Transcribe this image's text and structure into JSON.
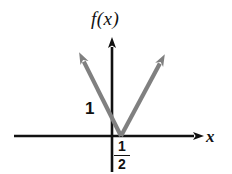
{
  "figure": {
    "width": 232,
    "height": 174,
    "background_color": "#ffffff"
  },
  "labels": {
    "function_label": "f(x)",
    "x_axis_label": "x",
    "y_intercept_label": "1",
    "vertex_fraction_numerator": "1",
    "vertex_fraction_denominator": "2"
  },
  "colors": {
    "axis_color": "#111111",
    "curve_color": "#808080",
    "text_color": "#111111"
  },
  "chart_data": {
    "type": "line",
    "title": "",
    "xlabel": "x",
    "ylabel": "f(x)",
    "subtitle": "",
    "grid": false,
    "legend": null,
    "xlim": [
      -1.2,
      2.6
    ],
    "ylim": [
      -0.55,
      2.6
    ],
    "axes": {
      "x_axis": {
        "from_px": [
          14,
          136
        ],
        "to_px": [
          202,
          136
        ],
        "arrow_at": "right"
      },
      "y_axis": {
        "from_px": [
          112,
          172
        ],
        "to_px": [
          112,
          37
        ],
        "arrow_at": "top"
      },
      "origin_px": [
        112,
        136
      ]
    },
    "series": [
      {
        "name": "f(x) = 2|x - 1/2|",
        "color": "#808080",
        "points_px": [
          [
            78,
            50
          ],
          [
            121,
            136
          ],
          [
            166,
            52
          ]
        ],
        "vertex": {
          "x": 0.5,
          "y": 0
        },
        "y_intercept": {
          "x": 0,
          "y": 1
        },
        "arrow_ends": [
          "left-up",
          "right-up"
        ]
      }
    ],
    "annotations": [
      {
        "text": "1",
        "kind": "y-intercept-tick-label",
        "position_px": [
          91,
          110
        ],
        "value": 1
      },
      {
        "text": "1/2",
        "kind": "x-vertex-label",
        "position_px": [
          122,
          154
        ],
        "value": 0.5
      },
      {
        "text": "f(x)",
        "kind": "axis-title",
        "position_px": [
          113,
          22
        ]
      },
      {
        "text": "x",
        "kind": "axis-title",
        "position_px": [
          212,
          137
        ]
      }
    ]
  }
}
